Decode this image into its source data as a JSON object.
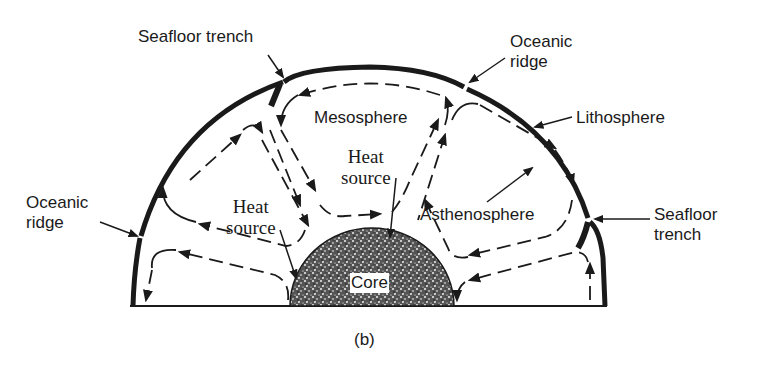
{
  "figure": {
    "caption": "(b)",
    "colors": {
      "ink": "#1a1a1a",
      "background": "#ffffff",
      "core_fill": "#3a3a3a"
    }
  },
  "labels": {
    "seafloor_trench_top": "Seafloor trench",
    "oceanic_ridge_top_line1": "Oceanic",
    "oceanic_ridge_top_line2": "ridge",
    "lithosphere": "Lithosphere",
    "mesosphere": "Mesosphere",
    "heat_source_center_line1": "Heat",
    "heat_source_center_line2": "source",
    "heat_source_left_line1": "Heat",
    "heat_source_left_line2": "source",
    "asthenosphere": "Asthenosphere",
    "oceanic_ridge_left_line1": "Oceanic",
    "oceanic_ridge_left_line2": "ridge",
    "seafloor_trench_right_line1": "Seafloor",
    "seafloor_trench_right_line2": "trench",
    "core": "Core"
  }
}
